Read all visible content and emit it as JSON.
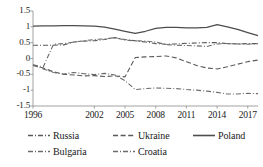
{
  "chart_data": {
    "type": "line",
    "title": "",
    "xlabel": "",
    "ylabel": "",
    "ylim": [
      -1.5,
      1.5
    ],
    "xlim": [
      1996,
      2018
    ],
    "grid": false,
    "legend_position": "bottom",
    "ytick_labels": [
      "1.5",
      "1",
      "0.5",
      "0",
      "-0.5",
      "-1",
      "-1.5"
    ],
    "ytick_values": [
      1.5,
      1,
      0.5,
      0,
      -0.5,
      -1,
      -1.5
    ],
    "xtick_labels": [
      "1996",
      "2002",
      "2005",
      "2008",
      "2011",
      "2014",
      "2017"
    ],
    "xtick_values": [
      1996,
      2002,
      2005,
      2008,
      2011,
      2014,
      2017
    ],
    "x": [
      1996,
      1997,
      1998,
      1999,
      2000,
      2001,
      2002,
      2003,
      2004,
      2005,
      2006,
      2007,
      2008,
      2009,
      2010,
      2011,
      2012,
      2013,
      2014,
      2015,
      2016,
      2017,
      2018
    ],
    "series": [
      {
        "name": "Russia",
        "style": "dash-dot",
        "color": "#595959",
        "values": [
          0.42,
          0.42,
          0.42,
          0.43,
          0.52,
          0.55,
          0.56,
          0.6,
          0.66,
          0.6,
          0.56,
          0.52,
          0.47,
          0.45,
          0.46,
          0.48,
          0.49,
          0.5,
          0.5,
          0.47,
          0.46,
          0.47,
          0.47
        ]
      },
      {
        "name": "Ukraine",
        "style": "dashed",
        "color": "#595959",
        "values": [
          -0.22,
          -0.3,
          -0.42,
          -0.5,
          -0.52,
          -0.55,
          -0.54,
          -0.57,
          -0.55,
          -0.58,
          0.03,
          0.05,
          0.06,
          0.08,
          0.02,
          -0.1,
          -0.22,
          -0.3,
          -0.33,
          -0.26,
          -0.18,
          -0.1,
          -0.05
        ]
      },
      {
        "name": "Poland",
        "style": "solid",
        "color": "#4d4d4d",
        "values": [
          1.02,
          1.03,
          1.03,
          1.04,
          1.04,
          1.03,
          1.02,
          0.99,
          0.93,
          0.86,
          0.79,
          0.86,
          0.95,
          0.98,
          0.98,
          0.97,
          0.97,
          0.98,
          1.07,
          1.0,
          0.92,
          0.82,
          0.72
        ]
      },
      {
        "name": "Bulgaria",
        "style": "dash-dot",
        "color": "#6b6b6b",
        "values": [
          -0.2,
          -0.27,
          0.45,
          0.47,
          0.52,
          0.56,
          0.6,
          0.62,
          0.66,
          0.58,
          0.56,
          0.55,
          0.52,
          0.44,
          0.42,
          0.41,
          0.4,
          0.38,
          0.46,
          0.47,
          0.46,
          0.45,
          0.47
        ]
      },
      {
        "name": "Croatia",
        "style": "dash-dot",
        "color": "#6b6b6b",
        "values": [
          -0.2,
          -0.33,
          -0.44,
          -0.49,
          -0.44,
          -0.48,
          -0.51,
          -0.47,
          -0.52,
          -0.7,
          -0.98,
          -0.95,
          -0.93,
          -0.94,
          -0.95,
          -0.98,
          -1.0,
          -1.03,
          -1.07,
          -1.12,
          -1.12,
          -1.1,
          -1.11
        ]
      }
    ]
  },
  "legend": {
    "items": [
      {
        "label": "Russia",
        "style": "dash-dot"
      },
      {
        "label": "Ukraine",
        "style": "dashed"
      },
      {
        "label": "Poland",
        "style": "solid"
      },
      {
        "label": "Bulgaria",
        "style": "dash-dot"
      },
      {
        "label": "Croatia",
        "style": "dash-dot"
      }
    ]
  },
  "axis": {
    "line_color": "#8c8c8c"
  }
}
